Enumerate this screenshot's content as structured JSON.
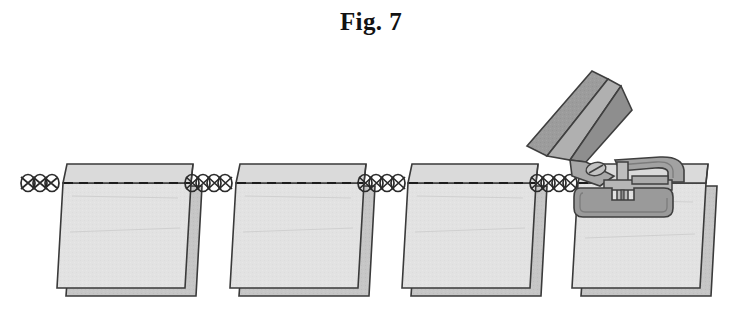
{
  "figure": {
    "caption": "Fig. 7",
    "title_label": "Fig. 7",
    "width": 742,
    "height": 323,
    "background_color": "#ffffff"
  },
  "colors": {
    "fabric_front": "#e2e2e2",
    "fabric_back": "#c6c6c6",
    "fabric_flap": "#d8d8d8",
    "outline": "#3a3a3a",
    "stitch_line": "#1c1c1c",
    "thread_chain": "#2b2b2b",
    "machine_body": "#9a9a9a",
    "machine_light": "#b4b4b4",
    "machine_dark": "#7c7c7c",
    "machine_outline": "#3f3f3f",
    "caption_color": "#121212"
  },
  "stitch": {
    "line_y": 183,
    "dash_pattern": "9 6",
    "dash_width": 2.2,
    "chain_loop_count_per_gap": 5,
    "chain_loop_rx": 7,
    "chain_loop_ry": 9
  },
  "panels": [
    {
      "id": "panel-1",
      "label": "fabric-panel-1",
      "x": 55,
      "top_y": 163,
      "width": 135,
      "height": 123,
      "flap_height": 20
    },
    {
      "id": "panel-2",
      "label": "fabric-panel-2",
      "x": 228,
      "top_y": 163,
      "width": 135,
      "height": 123,
      "flap_height": 20
    },
    {
      "id": "panel-3",
      "label": "fabric-panel-3",
      "x": 400,
      "top_y": 163,
      "width": 135,
      "height": 123,
      "flap_height": 20
    },
    {
      "id": "panel-4",
      "label": "fabric-panel-4",
      "x": 570,
      "top_y": 163,
      "width": 135,
      "height": 123,
      "flap_height": 20
    }
  ],
  "chain_gaps": [
    {
      "id": "chain-left-tail",
      "x_start": 22,
      "x_end": 60
    },
    {
      "id": "chain-gap-1-2",
      "x_start": 188,
      "x_end": 232
    },
    {
      "id": "chain-gap-2-3",
      "x_start": 360,
      "x_end": 404
    },
    {
      "id": "chain-gap-3-4",
      "x_start": 532,
      "x_end": 576
    }
  ],
  "machine": {
    "label": "sewing-machine-presser-assembly",
    "parts": [
      {
        "id": "presser-lever-arm",
        "label": "raised presser foot lever"
      },
      {
        "id": "presser-blade",
        "label": "lever blade edge"
      },
      {
        "id": "presser-foot-shank",
        "label": "foot shank with slotted screw"
      },
      {
        "id": "screw-head",
        "label": "slotted screw head"
      },
      {
        "id": "needle-bar",
        "label": "needle bar"
      },
      {
        "id": "needle",
        "label": "needle"
      },
      {
        "id": "presser-foot-plate",
        "label": "presser foot sole plate"
      },
      {
        "id": "foot-bracket",
        "label": "foot mounting bracket"
      }
    ]
  }
}
